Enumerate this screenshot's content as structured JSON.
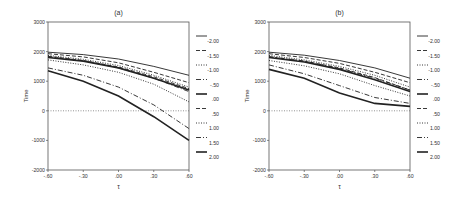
{
  "figure": {
    "panels": [
      {
        "id": "a",
        "title": "(a)"
      },
      {
        "id": "b",
        "title": "(b)"
      }
    ]
  },
  "chart_data": [
    {
      "type": "line",
      "title": "(a)",
      "xlabel": "τ",
      "ylabel": "Time",
      "x": [
        -0.6,
        -0.3,
        0.0,
        0.3,
        0.6
      ],
      "xtick_labels": [
        "-.60",
        "-.30",
        ".00",
        ".30",
        ".60"
      ],
      "ylim": [
        -2000,
        3000
      ],
      "ytick_labels": [
        "3000",
        "2000",
        "1000",
        "0",
        "-1000",
        "-2000"
      ],
      "reference_line": {
        "y": 0,
        "style": "dotted"
      },
      "legend_position": "right",
      "series": [
        {
          "name": "-2.00",
          "style": "solid-thin",
          "values": [
            1980,
            1900,
            1750,
            1500,
            1200
          ]
        },
        {
          "name": "-1.50",
          "style": "dashed",
          "values": [
            1930,
            1820,
            1620,
            1300,
            950
          ]
        },
        {
          "name": "-1.00",
          "style": "dotted",
          "values": [
            1870,
            1740,
            1530,
            1200,
            800
          ]
        },
        {
          "name": "-.50",
          "style": "dash-dot",
          "values": [
            1830,
            1690,
            1450,
            1100,
            650
          ]
        },
        {
          "name": ".00",
          "style": "solid-thick",
          "values": [
            1800,
            1680,
            1450,
            1100,
            700
          ]
        },
        {
          "name": ".50",
          "style": "dashed",
          "values": [
            1840,
            1700,
            1480,
            1150,
            750
          ]
        },
        {
          "name": "1.00",
          "style": "dotted",
          "values": [
            1720,
            1550,
            1300,
            900,
            300
          ]
        },
        {
          "name": "1.50",
          "style": "dash-dot",
          "values": [
            1450,
            1200,
            800,
            200,
            -600
          ]
        },
        {
          "name": "2.00",
          "style": "solid-thick",
          "values": [
            1350,
            1000,
            500,
            -200,
            -1000
          ]
        }
      ]
    },
    {
      "type": "line",
      "title": "(b)",
      "xlabel": "τ",
      "ylabel": "Time",
      "x": [
        -0.6,
        -0.3,
        0.0,
        0.3,
        0.6
      ],
      "xtick_labels": [
        "-.60",
        "-.30",
        ".00",
        ".30",
        ".60"
      ],
      "ylim": [
        -2000,
        3000
      ],
      "ytick_labels": [
        "3000",
        "2000",
        "1000",
        "0",
        "-1000",
        "-2000"
      ],
      "reference_line": {
        "y": 0,
        "style": "dotted"
      },
      "legend_position": "right",
      "series": [
        {
          "name": "-2.00",
          "style": "solid-thin",
          "values": [
            1980,
            1880,
            1700,
            1450,
            1100
          ]
        },
        {
          "name": "-1.50",
          "style": "dashed",
          "values": [
            1930,
            1800,
            1600,
            1300,
            950
          ]
        },
        {
          "name": "-1.00",
          "style": "dotted",
          "values": [
            1870,
            1720,
            1500,
            1200,
            800
          ]
        },
        {
          "name": "-.50",
          "style": "dash-dot",
          "values": [
            1830,
            1680,
            1430,
            1100,
            700
          ]
        },
        {
          "name": ".00",
          "style": "solid-thick",
          "values": [
            1800,
            1650,
            1400,
            1050,
            650
          ]
        },
        {
          "name": ".50",
          "style": "dashed",
          "values": [
            1820,
            1680,
            1450,
            1120,
            700
          ]
        },
        {
          "name": "1.00",
          "style": "dotted",
          "values": [
            1700,
            1520,
            1250,
            850,
            500
          ]
        },
        {
          "name": "1.50",
          "style": "dash-dot",
          "values": [
            1550,
            1250,
            850,
            450,
            250
          ]
        },
        {
          "name": "2.00",
          "style": "solid-thick",
          "values": [
            1400,
            1100,
            600,
            250,
            150
          ]
        }
      ]
    }
  ]
}
